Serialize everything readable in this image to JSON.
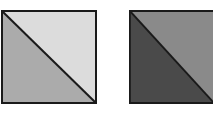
{
  "figure": {
    "squares": [
      {
        "name": "left-square",
        "upper_right_triangle_color": "#dcdcdc",
        "lower_left_triangle_color": "#ababab",
        "border_color": "#1a1a1a",
        "diagonal": "top-left to bottom-right"
      },
      {
        "name": "right-square",
        "upper_right_triangle_color": "#8a8a8a",
        "lower_left_triangle_color": "#4a4a4a",
        "border_color": "#1a1a1a",
        "diagonal": "top-left to bottom-right"
      }
    ]
  }
}
